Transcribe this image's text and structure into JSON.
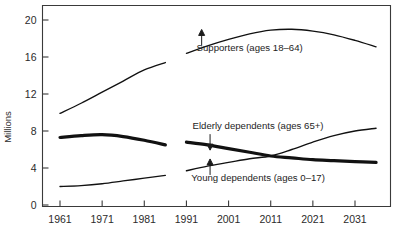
{
  "chart_data": {
    "type": "line",
    "title": "",
    "subtitle": "",
    "xlabel": "",
    "ylabel": "Millions",
    "xlim": [
      1961,
      2036
    ],
    "ylim": [
      0,
      21.5
    ],
    "grid": false,
    "legend_position": "inline-annotations",
    "x_ticks": [
      "1961",
      "1971",
      "1981",
      "1991",
      "2001",
      "2011",
      "2021",
      "2031"
    ],
    "x_tick_values": [
      1961,
      1971,
      1981,
      1991,
      2001,
      2011,
      2021,
      2031
    ],
    "y_ticks": [
      "0",
      "4",
      "8",
      "12",
      "16",
      "20"
    ],
    "y_tick_values": [
      0,
      4,
      8,
      12,
      16,
      20
    ],
    "note": "Two data blocks: historical 1961-1986 and projected 1991-2036, separated by a gap.",
    "series": [
      {
        "name": "Supporters (ages 18-64)",
        "style": "thin",
        "segments": [
          {
            "period": "historical",
            "x": [
              1961,
              1966,
              1971,
              1976,
              1981,
              1986
            ],
            "values": [
              9.9,
              11.0,
              12.2,
              13.4,
              14.6,
              15.4
            ]
          },
          {
            "period": "projected",
            "x": [
              1991,
              1996,
              2001,
              2006,
              2011,
              2016,
              2021,
              2026,
              2031,
              2036
            ],
            "values": [
              16.4,
              17.2,
              17.9,
              18.5,
              18.9,
              19.0,
              18.8,
              18.4,
              17.8,
              17.1
            ]
          }
        ]
      },
      {
        "name": "Elderly dependents (ages 65+)",
        "style": "thick",
        "segments": [
          {
            "period": "historical",
            "x": [
              1961,
              1966,
              1971,
              1976,
              1981,
              1986
            ],
            "values": [
              7.3,
              7.5,
              7.6,
              7.4,
              7.0,
              6.5
            ]
          },
          {
            "period": "projected",
            "x": [
              1991,
              1996,
              2001,
              2006,
              2011,
              2016,
              2021,
              2026,
              2031,
              2036
            ],
            "values": [
              6.8,
              6.5,
              6.1,
              5.7,
              5.3,
              5.1,
              4.9,
              4.8,
              4.7,
              4.6
            ]
          }
        ]
      },
      {
        "name": "Young dependents (ages 0-17)",
        "style": "thin",
        "segments": [
          {
            "period": "historical",
            "x": [
              1961,
              1966,
              1971,
              1976,
              1981,
              1986
            ],
            "values": [
              2.0,
              2.1,
              2.3,
              2.6,
              2.9,
              3.2
            ]
          },
          {
            "period": "projected",
            "x": [
              1991,
              1996,
              2001,
              2006,
              2011,
              2016,
              2021,
              2026,
              2031,
              2036
            ],
            "values": [
              3.7,
              4.2,
              4.6,
              5.0,
              5.3,
              6.0,
              6.8,
              7.5,
              8.0,
              8.3
            ]
          }
        ]
      }
    ],
    "annotations": [
      {
        "id": "supporters",
        "text": "Supporters (ages 18–64)",
        "x": 2006,
        "y": 16.6,
        "arrow": "up"
      },
      {
        "id": "elderly",
        "text": "Elderly dependents (ages 65+)",
        "x": 2008,
        "y": 8.2,
        "arrow": "down"
      },
      {
        "id": "young",
        "text": "Young dependents (ages 0–17)",
        "x": 2008,
        "y": 2.6,
        "arrow": "up"
      }
    ]
  }
}
